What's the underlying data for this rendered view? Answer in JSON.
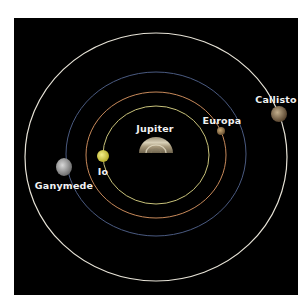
{
  "diagram": {
    "background_color": "#000000",
    "center": {
      "name": "Jupiter",
      "label": "Jupiter",
      "x": 156,
      "y": 153,
      "color": "#b8ab8a"
    },
    "orbits": [
      {
        "name": "Io orbit",
        "rx": 53,
        "ry": 49,
        "color": "#c8c27a"
      },
      {
        "name": "Europa orbit",
        "rx": 70,
        "ry": 63,
        "color": "#c7895a"
      },
      {
        "name": "Ganymede orbit",
        "rx": 90,
        "ry": 82,
        "color": "#4a5a80"
      },
      {
        "name": "Callisto orbit",
        "rx": 131,
        "ry": 124,
        "color": "#e6e2d6"
      }
    ],
    "moons": [
      {
        "name": "Io",
        "label": "Io",
        "x": 103,
        "y": 156,
        "r": 6,
        "color": "#d9d24a",
        "label_x": 103,
        "label_y": 171
      },
      {
        "name": "Europa",
        "label": "Europa",
        "x": 221,
        "y": 131,
        "r": 4,
        "color": "#9b7c4e",
        "label_x": 222,
        "label_y": 120
      },
      {
        "name": "Ganymede",
        "label": "Ganymede",
        "x": 64,
        "y": 167,
        "r": 8,
        "color": "#a9a9a9",
        "label_x": 64,
        "label_y": 185
      },
      {
        "name": "Callisto",
        "label": "Callisto",
        "x": 279,
        "y": 114,
        "r": 8,
        "color": "#8a7456",
        "label_x": 276,
        "label_y": 99
      }
    ]
  }
}
